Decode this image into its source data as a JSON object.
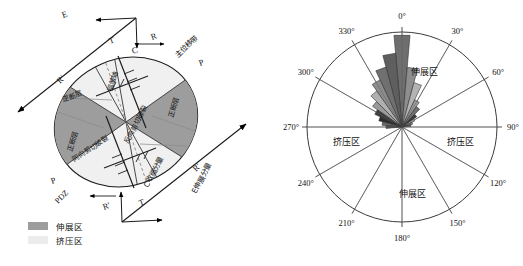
{
  "figure": {
    "panels": [
      "strain-ellipse-diagram",
      "rose-diagram"
    ]
  },
  "left_panel": {
    "name": "riedel-shear-strain-ellipse",
    "outer_labels": {
      "e_axis": "E",
      "c_axis": "C",
      "r_prime_upper": "R'",
      "r_prime_lower": "R'",
      "r_upper": "R",
      "r_lower": "R'",
      "t_upper": "T",
      "t_lower": "T",
      "p_upper": "P",
      "p_lower": "P",
      "pdz": "PDZ",
      "principal_displacement_zone": "主位移带",
      "c_contraction_component": "C收缩分量",
      "e_extension_component": "E伸展分量"
    },
    "sector_labels": {
      "reverse_fault": "逆断层",
      "normal_fault_right": "正断层",
      "normal_fault_left": "正断层",
      "fold_axis": "褶皱轴",
      "synthetic_shear_fracture": "同向剪切破裂",
      "antithetic_shear_fracture": "反向剪切破裂"
    },
    "legend": {
      "items": [
        {
          "label": "伸展区",
          "color": "#9a9a9a"
        },
        {
          "label": "挤压区",
          "color": "#ececec"
        }
      ]
    }
  },
  "right_panel": {
    "name": "rose-diagram",
    "zone_labels": {
      "extension_top": "伸展区",
      "extension_bottom": "伸展区",
      "compression_left": "挤压区",
      "compression_right": "挤压区"
    }
  },
  "chart_data": {
    "type": "rose",
    "title": "",
    "xlabel": "",
    "ylabel": "",
    "angle_unit": "degrees",
    "bin_width": 10,
    "radius_max": 95,
    "tick_labels": [
      "0°",
      "30°",
      "60°",
      "90°",
      "120°",
      "150°",
      "180°",
      "210°",
      "240°",
      "270°",
      "300°",
      "330°"
    ],
    "tick_angles": [
      0,
      30,
      60,
      90,
      120,
      150,
      180,
      210,
      240,
      270,
      300,
      330
    ],
    "spoke_angles": [
      0,
      30,
      60,
      90,
      120,
      150,
      180,
      210,
      240,
      270,
      300,
      330
    ],
    "grid": false,
    "legend_position": "none",
    "petals": [
      {
        "angle": 0,
        "value": 92,
        "color": "#6e6e6e"
      },
      {
        "angle": 10,
        "value": 60,
        "color": "#8e8e8e"
      },
      {
        "angle": 20,
        "value": 46,
        "color": "#b4b4b4"
      },
      {
        "angle": 30,
        "value": 30,
        "color": "#9b9b9b"
      },
      {
        "angle": 40,
        "value": 25,
        "color": "#707070"
      },
      {
        "angle": 50,
        "value": 18,
        "color": "#3a3a3a"
      },
      {
        "angle": 60,
        "value": 14,
        "color": "#a8a8a8"
      },
      {
        "angle": 70,
        "value": 11,
        "color": "#8a8a8a"
      },
      {
        "angle": 80,
        "value": 9,
        "color": "#5e5e5e"
      },
      {
        "angle": 350,
        "value": 74,
        "color": "#5f5f5f"
      },
      {
        "angle": 340,
        "value": 62,
        "color": "#707070"
      },
      {
        "angle": 330,
        "value": 52,
        "color": "#8c8c8c"
      },
      {
        "angle": 320,
        "value": 44,
        "color": "#b0b0b0"
      },
      {
        "angle": 310,
        "value": 36,
        "color": "#9a9a9a"
      },
      {
        "angle": 300,
        "value": 30,
        "color": "#3e3e3e"
      },
      {
        "angle": 290,
        "value": 24,
        "color": "#2e2e2e"
      },
      {
        "angle": 280,
        "value": 20,
        "color": "#6a6a6a"
      },
      {
        "angle": 270,
        "value": 16,
        "color": "#585858"
      }
    ]
  }
}
